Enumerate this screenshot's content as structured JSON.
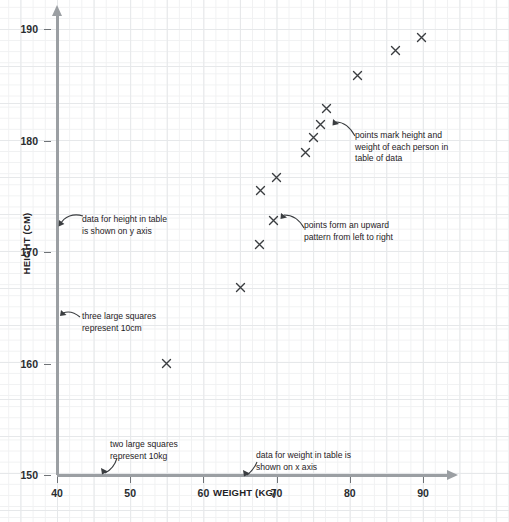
{
  "figure": {
    "kind": "scatter-graph-worksheet",
    "grid_background": "graph-paper",
    "grid_color_small": "#f0f1f2",
    "grid_color_large": "#e6e8ea",
    "axis_color": "#9b9fa3",
    "marker_color": "#3a3d40",
    "marker_glyph": "x-cross"
  },
  "chart_data": {
    "type": "scatter",
    "title": "",
    "subtitle": "",
    "xlabel": "WEIGHT (KG)",
    "ylabel": "HEIGHT (CM)",
    "xlim": [
      40,
      93
    ],
    "ylim": [
      150,
      191
    ],
    "xticks": [
      40,
      50,
      60,
      70,
      80,
      90
    ],
    "yticks": [
      150,
      160,
      170,
      180,
      190
    ],
    "xtick_labels": [
      "40",
      "50",
      "60",
      "70",
      "80",
      "90"
    ],
    "ytick_labels": [
      "150",
      "160",
      "170",
      "180",
      "190"
    ],
    "grid": true,
    "grid_minor_per_major_x": 3,
    "grid_minor_per_major_y": 3,
    "legend": null,
    "x_minor_step_kg": 5,
    "y_minor_step_cm": 3.33,
    "points": [
      {
        "weight": 55,
        "height": 160
      },
      {
        "weight": 65,
        "height": 166.8
      },
      {
        "weight": 67.7,
        "height": 170.7
      },
      {
        "weight": 69.6,
        "height": 172.8
      },
      {
        "weight": 67.8,
        "height": 175.5
      },
      {
        "weight": 70,
        "height": 176.7
      },
      {
        "weight": 73.9,
        "height": 178.9
      },
      {
        "weight": 75.1,
        "height": 180.3
      },
      {
        "weight": 76,
        "height": 181.4
      },
      {
        "weight": 76.8,
        "height": 182.9
      },
      {
        "weight": 81,
        "height": 185.8
      },
      {
        "weight": 86.3,
        "height": 188.1
      },
      {
        "weight": 89.8,
        "height": 189.2
      }
    ],
    "trend": "upward pattern from left to right"
  },
  "annotations": [
    {
      "id": "y-axis-data-note",
      "text": "data for height in table\nis shown on y axis"
    },
    {
      "id": "y-scale-note",
      "text": "three large squares\nrepresent 10cm"
    },
    {
      "id": "x-scale-note",
      "text": "two large squares\nrepresent 10kg"
    },
    {
      "id": "x-axis-data-note",
      "text": "data for weight in table is\nshown on x axis"
    },
    {
      "id": "points-meaning-note",
      "text": "points mark height and\nweight of each person in\ntable of data"
    },
    {
      "id": "points-pattern-note",
      "text": "points form an upward\npattern from left to right"
    }
  ],
  "edge_fragment": {
    "text": ""
  }
}
